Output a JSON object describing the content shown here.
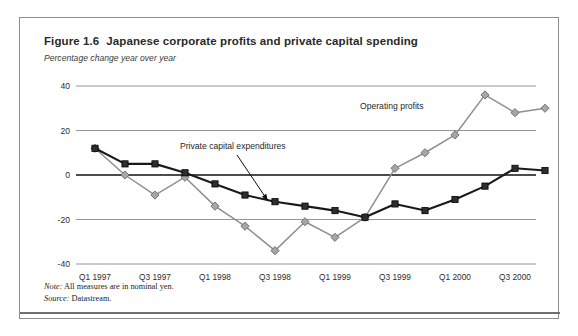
{
  "figure": {
    "number": "Figure 1.6",
    "title": "Japanese corporate profits and private capital spending",
    "subtitle": "Percentage change year over year",
    "note_label": "Note:",
    "note_text": " All measures are in nominal yen.",
    "source_label": "Source:",
    "source_text": " Datastream."
  },
  "colors": {
    "operating_profits": "#8f8f8f",
    "private_capital": "#1a1a1a",
    "gridline": "#8a8a8a",
    "zero_line": "#111111",
    "card_border": "#8d8d8d"
  },
  "chart_data": {
    "type": "line",
    "title": "Japanese corporate profits and private capital spending",
    "subtitle": "Percentage change year over year",
    "xlabel": "",
    "ylabel": "Percentage change year over year",
    "ylim": [
      -40,
      40
    ],
    "yticks": [
      40,
      20,
      0,
      -20,
      -40
    ],
    "ytick_labels": [
      "40",
      "20",
      "0",
      "-20",
      "-40"
    ],
    "grid": true,
    "legend": "annotations-on-plot",
    "x": [
      "Q1 1997",
      "Q2 1997",
      "Q3 1997",
      "Q4 1997",
      "Q1 1998",
      "Q2 1998",
      "Q3 1998",
      "Q4 1998",
      "Q1 1999",
      "Q2 1999",
      "Q3 1999",
      "Q4 1999",
      "Q1 2000",
      "Q2 2000",
      "Q3 2000",
      "Q4 2000"
    ],
    "xtick_labels": [
      "Q1 1997",
      "Q3 1997",
      "Q1 1998",
      "Q3 1998",
      "Q1 1999",
      "Q3 1999",
      "Q1 2000",
      "Q3 2000"
    ],
    "xtick_indices": [
      0,
      2,
      4,
      6,
      8,
      10,
      12,
      14
    ],
    "series": [
      {
        "name": "Operating profits",
        "color": "#8f8f8f",
        "marker": "diamond",
        "values": [
          12,
          0,
          -9,
          -1,
          -14,
          -23,
          -34,
          -21,
          -28,
          -19,
          3,
          10,
          18,
          36,
          28,
          30
        ]
      },
      {
        "name": "Private capital expenditures",
        "color": "#1a1a1a",
        "marker": "square",
        "values": [
          12,
          5,
          5,
          1,
          -4,
          -9,
          -12,
          -14,
          -16,
          -19,
          -13,
          -16,
          -11,
          -5,
          3,
          2
        ]
      }
    ],
    "annotations": [
      {
        "text": "Private capital expenditures",
        "text_x": 160,
        "text_y": 131,
        "arrow_from_x": 217,
        "arrow_from_y": 137,
        "arrow_to_x": 248,
        "arrow_to_y": 183
      },
      {
        "text": "Operating profits",
        "text_x": 340,
        "text_y": 91,
        "arrow_from_x": null,
        "arrow_from_y": null,
        "arrow_to_x": null,
        "arrow_to_y": null
      }
    ]
  }
}
